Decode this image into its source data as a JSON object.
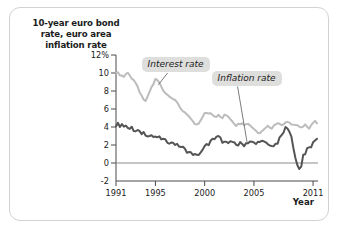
{
  "chart_data": {
    "type": "line",
    "title": "10-year euro bond rate, euro area inflation rate",
    "title_lines": [
      "10-year euro bond",
      "rate, euro area",
      "inflation rate"
    ],
    "xlabel": "Year",
    "ylabel": "",
    "xlim": [
      1991,
      2011.5
    ],
    "ylim": [
      -2,
      12
    ],
    "grid": false,
    "zero_line": true,
    "legend_position": "annotations-on-plot",
    "y_ticks": [
      {
        "value": 12,
        "label": "12%"
      },
      {
        "value": 10,
        "label": "10"
      },
      {
        "value": 8,
        "label": "8"
      },
      {
        "value": 6,
        "label": "6"
      },
      {
        "value": 4,
        "label": "4"
      },
      {
        "value": 2,
        "label": "2"
      },
      {
        "value": 0,
        "label": "0"
      },
      {
        "value": -2,
        "label": "-2"
      }
    ],
    "x_ticks": [
      {
        "value": 1991,
        "label": "1991"
      },
      {
        "value": 1995,
        "label": "1995"
      },
      {
        "value": 2000,
        "label": "2000"
      },
      {
        "value": 2005,
        "label": "2005"
      },
      {
        "value": 2011,
        "label": "2011"
      }
    ],
    "annotations": [
      {
        "text": "Interest rate",
        "target_series": "Interest rate",
        "box_x": 1993.6,
        "box_y": 11.0,
        "point_x": 1995.3,
        "point_y": 8.7
      },
      {
        "text": "Inflation rate",
        "target_series": "Inflation rate",
        "box_x": 2000.7,
        "box_y": 9.5,
        "point_x": 2004.3,
        "point_y": 2.3
      }
    ],
    "series": [
      {
        "name": "Interest rate",
        "color": "#bcbcbc",
        "width": 2.0,
        "x": [
          1991.0,
          1991.2,
          1991.4,
          1991.6,
          1991.8,
          1992.0,
          1992.2,
          1992.4,
          1992.6,
          1992.8,
          1993.0,
          1993.2,
          1993.4,
          1993.6,
          1993.8,
          1994.0,
          1994.2,
          1994.4,
          1994.6,
          1994.8,
          1995.0,
          1995.2,
          1995.4,
          1995.6,
          1995.8,
          1996.0,
          1996.2,
          1996.4,
          1996.6,
          1996.8,
          1997.0,
          1997.2,
          1997.4,
          1997.6,
          1997.8,
          1998.0,
          1998.2,
          1998.4,
          1998.6,
          1998.8,
          1999.0,
          1999.2,
          1999.4,
          1999.6,
          1999.8,
          2000.0,
          2000.2,
          2000.4,
          2000.6,
          2000.8,
          2001.0,
          2001.2,
          2001.4,
          2001.6,
          2001.8,
          2002.0,
          2002.2,
          2002.4,
          2002.6,
          2002.8,
          2003.0,
          2003.2,
          2003.4,
          2003.6,
          2003.8,
          2004.0,
          2004.2,
          2004.4,
          2004.6,
          2004.8,
          2005.0,
          2005.2,
          2005.4,
          2005.6,
          2005.8,
          2006.0,
          2006.2,
          2006.4,
          2006.6,
          2006.8,
          2007.0,
          2007.2,
          2007.4,
          2007.6,
          2007.8,
          2008.0,
          2008.2,
          2008.4,
          2008.6,
          2008.8,
          2009.0,
          2009.2,
          2009.4,
          2009.6,
          2009.8,
          2010.0,
          2010.2,
          2010.4,
          2010.6,
          2010.8,
          2011.0,
          2011.2,
          2011.4
        ],
        "y": [
          10.1,
          10.0,
          9.8,
          9.7,
          9.6,
          9.9,
          10.0,
          9.8,
          9.4,
          9.2,
          8.8,
          8.4,
          7.9,
          7.4,
          7.0,
          6.9,
          7.3,
          7.9,
          8.4,
          8.8,
          9.3,
          9.2,
          8.9,
          8.5,
          8.1,
          7.8,
          7.6,
          7.5,
          7.3,
          7.1,
          6.9,
          6.7,
          6.4,
          6.0,
          5.8,
          5.6,
          5.3,
          5.1,
          4.9,
          4.6,
          4.3,
          4.2,
          4.4,
          4.8,
          5.1,
          5.5,
          5.6,
          5.5,
          5.6,
          5.4,
          5.2,
          5.2,
          5.3,
          5.1,
          5.0,
          5.3,
          5.3,
          5.2,
          4.9,
          4.7,
          4.4,
          4.2,
          4.3,
          4.4,
          4.5,
          4.3,
          4.3,
          4.4,
          4.2,
          4.0,
          3.8,
          3.6,
          3.4,
          3.4,
          3.6,
          3.7,
          4.0,
          4.1,
          4.0,
          3.9,
          4.1,
          4.3,
          4.5,
          4.4,
          4.3,
          4.3,
          4.5,
          4.6,
          4.5,
          4.2,
          4.2,
          4.3,
          4.2,
          4.0,
          3.9,
          4.0,
          4.2,
          4.1,
          3.9,
          4.2,
          4.5,
          4.6,
          4.5
        ]
      },
      {
        "name": "Inflation rate",
        "color": "#555555",
        "width": 2.0,
        "x": [
          1991.0,
          1991.2,
          1991.4,
          1991.6,
          1991.8,
          1992.0,
          1992.2,
          1992.4,
          1992.6,
          1992.8,
          1993.0,
          1993.2,
          1993.4,
          1993.6,
          1993.8,
          1994.0,
          1994.2,
          1994.4,
          1994.6,
          1994.8,
          1995.0,
          1995.2,
          1995.4,
          1995.6,
          1995.8,
          1996.0,
          1996.2,
          1996.4,
          1996.6,
          1996.8,
          1997.0,
          1997.2,
          1997.4,
          1997.6,
          1997.8,
          1998.0,
          1998.2,
          1998.4,
          1998.6,
          1998.8,
          1999.0,
          1999.2,
          1999.4,
          1999.6,
          1999.8,
          2000.0,
          2000.2,
          2000.4,
          2000.6,
          2000.8,
          2001.0,
          2001.2,
          2001.4,
          2001.6,
          2001.8,
          2002.0,
          2002.2,
          2002.4,
          2002.6,
          2002.8,
          2003.0,
          2003.2,
          2003.4,
          2003.6,
          2003.8,
          2004.0,
          2004.2,
          2004.4,
          2004.6,
          2004.8,
          2005.0,
          2005.2,
          2005.4,
          2005.6,
          2005.8,
          2006.0,
          2006.2,
          2006.4,
          2006.6,
          2006.8,
          2007.0,
          2007.2,
          2007.4,
          2007.6,
          2007.8,
          2008.0,
          2008.2,
          2008.4,
          2008.6,
          2008.8,
          2009.0,
          2009.2,
          2009.4,
          2009.6,
          2009.8,
          2010.0,
          2010.2,
          2010.4,
          2010.6,
          2010.8,
          2011.0,
          2011.2,
          2011.4
        ],
        "y": [
          4.2,
          4.6,
          4.0,
          4.4,
          3.9,
          4.3,
          4.0,
          3.8,
          3.9,
          3.6,
          3.5,
          3.6,
          3.4,
          3.3,
          3.4,
          3.2,
          3.1,
          3.0,
          3.1,
          2.9,
          2.8,
          2.9,
          2.8,
          2.7,
          2.6,
          2.5,
          2.4,
          2.3,
          2.2,
          2.3,
          2.1,
          2.0,
          1.9,
          1.8,
          1.7,
          1.5,
          1.3,
          1.2,
          1.1,
          1.0,
          0.9,
          0.8,
          1.0,
          1.2,
          1.4,
          1.8,
          2.0,
          2.1,
          2.4,
          2.6,
          2.5,
          2.9,
          3.0,
          2.7,
          2.4,
          2.5,
          2.3,
          2.2,
          2.3,
          2.2,
          2.3,
          2.1,
          2.0,
          2.2,
          2.1,
          2.0,
          2.2,
          2.3,
          2.4,
          2.3,
          2.2,
          2.1,
          2.3,
          2.5,
          2.4,
          2.3,
          2.2,
          2.1,
          1.9,
          2.0,
          1.9,
          2.0,
          2.2,
          2.7,
          3.1,
          3.3,
          3.9,
          4.0,
          3.6,
          2.8,
          1.6,
          0.6,
          -0.1,
          -0.7,
          -0.3,
          0.9,
          1.1,
          1.5,
          1.7,
          1.8,
          2.2,
          2.6,
          2.7
        ]
      }
    ]
  }
}
